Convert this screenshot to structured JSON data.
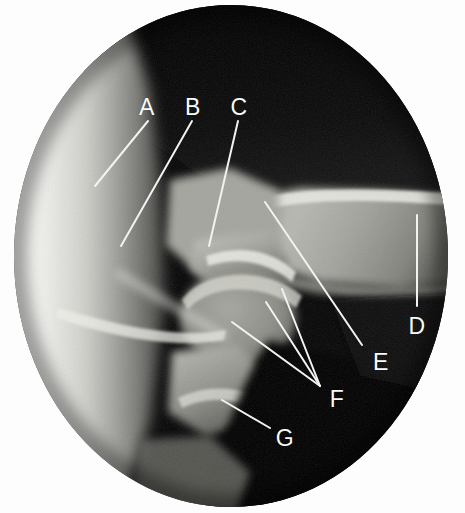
{
  "figure": {
    "kind": "radiograph",
    "modality_note": "plain-film x-ray, circular collimated field",
    "background_color": "#fdfdfd",
    "field_color_dark": "#050505",
    "bone_color_light": "#d8d8d4",
    "soft_tissue_color": "#8a8a86",
    "leader_line_color": "#f2f2f2",
    "label_color": "#fafafa",
    "width": 465,
    "height": 513
  },
  "labels": [
    {
      "id": "A",
      "text": "A",
      "x": 147,
      "y": 107
    },
    {
      "id": "B",
      "text": "B",
      "x": 193,
      "y": 107
    },
    {
      "id": "C",
      "text": "C",
      "x": 239,
      "y": 107
    },
    {
      "id": "D",
      "text": "D",
      "x": 417,
      "y": 326
    },
    {
      "id": "E",
      "text": "E",
      "x": 381,
      "y": 362
    },
    {
      "id": "F",
      "text": "F",
      "x": 337,
      "y": 399
    },
    {
      "id": "G",
      "text": "G",
      "x": 285,
      "y": 438
    }
  ],
  "leader_lines": [
    {
      "id": "A-leader",
      "from_label": "A",
      "x1": 148,
      "y1": 121,
      "x2": 95,
      "y2": 186
    },
    {
      "id": "B-leader",
      "from_label": "B",
      "x1": 192,
      "y1": 121,
      "x2": 121,
      "y2": 246
    },
    {
      "id": "C-leader",
      "from_label": "C",
      "x1": 238,
      "y1": 121,
      "x2": 209,
      "y2": 246
    },
    {
      "id": "D-leader",
      "from_label": "D",
      "x1": 417,
      "y1": 215,
      "x2": 417,
      "y2": 306
    },
    {
      "id": "E-leader",
      "from_label": "E",
      "x1": 265,
      "y1": 202,
      "x2": 362,
      "y2": 345
    },
    {
      "id": "F-leader-1",
      "from_label": "F",
      "x1": 266,
      "y1": 302,
      "x2": 320,
      "y2": 386
    },
    {
      "id": "F-leader-2",
      "from_label": "F",
      "x1": 232,
      "y1": 322,
      "x2": 320,
      "y2": 386
    },
    {
      "id": "F-leader-3",
      "from_label": "F",
      "x1": 282,
      "y1": 289,
      "x2": 320,
      "y2": 386
    },
    {
      "id": "G-leader",
      "from_label": "G",
      "x1": 222,
      "y1": 400,
      "x2": 270,
      "y2": 428
    }
  ],
  "caption": ""
}
